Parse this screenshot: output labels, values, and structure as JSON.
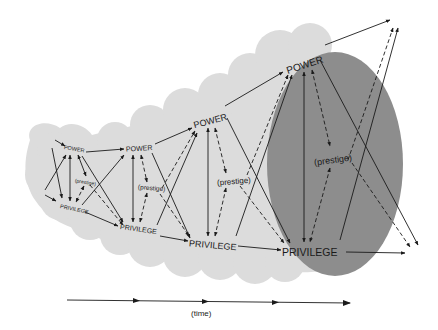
{
  "diagram": {
    "title": "",
    "colors": {
      "cloud": "#dedede",
      "cloud_edge": "#d6d6d6",
      "ellipse": "#8d8d8d",
      "ink": "#1a1a1a",
      "background": "#ffffff"
    },
    "stages": [
      {
        "power": "POWER",
        "prestige": "(prestige)",
        "privilege": "PRIVILEGE"
      },
      {
        "power": "POWER",
        "prestige": "(prestige)",
        "privilege": "PRIVILEGE"
      },
      {
        "power": "POWER",
        "prestige": "(prestige)",
        "privilege": "PRIVILEGE"
      },
      {
        "power": "POWER",
        "prestige": "(prestige)",
        "privilege": "PRIVILEGE"
      }
    ],
    "time_axis": {
      "label": "(time)",
      "arrow_count": 4
    }
  }
}
